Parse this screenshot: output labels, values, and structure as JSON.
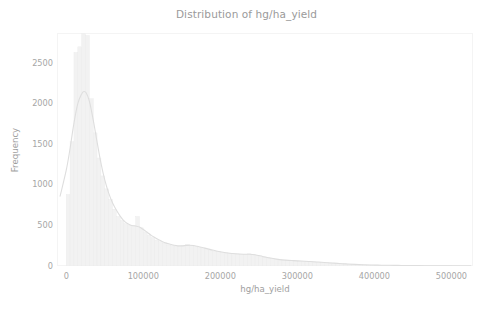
{
  "figure": {
    "width": 493,
    "height": 309,
    "background_color": "#ffffff"
  },
  "chart_data": {
    "type": "bar",
    "subtype": "histogram-with-kde",
    "title": "Distribution of hg/ha_yield",
    "xlabel": "hg/ha_yield",
    "ylabel": "Frequency",
    "xlim": [
      -12000,
      528000
    ],
    "ylim": [
      0,
      2870
    ],
    "grid": false,
    "legend": null,
    "xticks": [
      0,
      100000,
      200000,
      300000,
      400000,
      500000
    ],
    "xtick_labels": [
      "0",
      "100000",
      "200000",
      "300000",
      "400000",
      "500000"
    ],
    "yticks": [
      0,
      500,
      1000,
      1500,
      2000,
      2500
    ],
    "ytick_labels": [
      "0",
      "500",
      "1000",
      "1500",
      "2000",
      "2500"
    ],
    "bin_width": 5000,
    "bar_color": "#f2f2f2",
    "bar_edge_color": "#eaeaea",
    "kde_color": "#dedede",
    "axis_color": "#f2f2f2",
    "text_color": "#a3a3a3",
    "bins": [
      {
        "x": 2500,
        "value": 880
      },
      {
        "x": 7500,
        "value": 1530
      },
      {
        "x": 12500,
        "value": 2630
      },
      {
        "x": 17500,
        "value": 2700
      },
      {
        "x": 22500,
        "value": 2860
      },
      {
        "x": 27500,
        "value": 2840
      },
      {
        "x": 32500,
        "value": 2060
      },
      {
        "x": 37500,
        "value": 1640
      },
      {
        "x": 42500,
        "value": 1330
      },
      {
        "x": 47500,
        "value": 1110
      },
      {
        "x": 52500,
        "value": 950
      },
      {
        "x": 57500,
        "value": 820
      },
      {
        "x": 62500,
        "value": 700
      },
      {
        "x": 67500,
        "value": 610
      },
      {
        "x": 72500,
        "value": 560
      },
      {
        "x": 77500,
        "value": 520
      },
      {
        "x": 82500,
        "value": 500
      },
      {
        "x": 87500,
        "value": 500
      },
      {
        "x": 92500,
        "value": 610
      },
      {
        "x": 97500,
        "value": 470
      },
      {
        "x": 102500,
        "value": 420
      },
      {
        "x": 107500,
        "value": 380
      },
      {
        "x": 112500,
        "value": 350
      },
      {
        "x": 117500,
        "value": 320
      },
      {
        "x": 122500,
        "value": 300
      },
      {
        "x": 127500,
        "value": 280
      },
      {
        "x": 132500,
        "value": 260
      },
      {
        "x": 137500,
        "value": 250
      },
      {
        "x": 142500,
        "value": 245
      },
      {
        "x": 147500,
        "value": 240
      },
      {
        "x": 152500,
        "value": 250
      },
      {
        "x": 157500,
        "value": 265
      },
      {
        "x": 162500,
        "value": 255
      },
      {
        "x": 167500,
        "value": 240
      },
      {
        "x": 172500,
        "value": 225
      },
      {
        "x": 177500,
        "value": 215
      },
      {
        "x": 182500,
        "value": 205
      },
      {
        "x": 187500,
        "value": 195
      },
      {
        "x": 192500,
        "value": 185
      },
      {
        "x": 197500,
        "value": 175
      },
      {
        "x": 202500,
        "value": 168
      },
      {
        "x": 207500,
        "value": 160
      },
      {
        "x": 212500,
        "value": 155
      },
      {
        "x": 217500,
        "value": 150
      },
      {
        "x": 222500,
        "value": 148
      },
      {
        "x": 227500,
        "value": 145
      },
      {
        "x": 232500,
        "value": 143
      },
      {
        "x": 237500,
        "value": 150
      },
      {
        "x": 242500,
        "value": 142
      },
      {
        "x": 247500,
        "value": 130
      },
      {
        "x": 252500,
        "value": 120
      },
      {
        "x": 257500,
        "value": 110
      },
      {
        "x": 262500,
        "value": 100
      },
      {
        "x": 267500,
        "value": 92
      },
      {
        "x": 272500,
        "value": 85
      },
      {
        "x": 277500,
        "value": 78
      },
      {
        "x": 282500,
        "value": 72
      },
      {
        "x": 287500,
        "value": 68
      },
      {
        "x": 292500,
        "value": 65
      },
      {
        "x": 297500,
        "value": 62
      },
      {
        "x": 302500,
        "value": 60
      },
      {
        "x": 307500,
        "value": 58
      },
      {
        "x": 312500,
        "value": 55
      },
      {
        "x": 317500,
        "value": 52
      },
      {
        "x": 322500,
        "value": 50
      },
      {
        "x": 327500,
        "value": 47
      },
      {
        "x": 332500,
        "value": 44
      },
      {
        "x": 337500,
        "value": 40
      },
      {
        "x": 342500,
        "value": 37
      },
      {
        "x": 347500,
        "value": 34
      },
      {
        "x": 352500,
        "value": 31
      },
      {
        "x": 357500,
        "value": 28
      },
      {
        "x": 362500,
        "value": 25
      },
      {
        "x": 367500,
        "value": 22
      },
      {
        "x": 372500,
        "value": 20
      },
      {
        "x": 377500,
        "value": 18
      },
      {
        "x": 382500,
        "value": 16
      },
      {
        "x": 387500,
        "value": 14
      },
      {
        "x": 392500,
        "value": 13
      },
      {
        "x": 397500,
        "value": 12
      },
      {
        "x": 402500,
        "value": 11
      },
      {
        "x": 407500,
        "value": 10
      },
      {
        "x": 412500,
        "value": 9
      },
      {
        "x": 417500,
        "value": 8
      },
      {
        "x": 422500,
        "value": 8
      },
      {
        "x": 427500,
        "value": 7
      },
      {
        "x": 432500,
        "value": 6
      },
      {
        "x": 437500,
        "value": 6
      },
      {
        "x": 442500,
        "value": 5
      },
      {
        "x": 447500,
        "value": 5
      },
      {
        "x": 452500,
        "value": 4
      },
      {
        "x": 457500,
        "value": 4
      },
      {
        "x": 462500,
        "value": 3
      },
      {
        "x": 467500,
        "value": 3
      },
      {
        "x": 472500,
        "value": 3
      },
      {
        "x": 477500,
        "value": 2
      },
      {
        "x": 482500,
        "value": 2
      },
      {
        "x": 487500,
        "value": 2
      },
      {
        "x": 492500,
        "value": 2
      },
      {
        "x": 497500,
        "value": 2
      },
      {
        "x": 502500,
        "value": 1
      },
      {
        "x": 507500,
        "value": 1
      }
    ],
    "kde": [
      {
        "x": -8000,
        "y": 860
      },
      {
        "x": 0,
        "y": 1180
      },
      {
        "x": 5000,
        "y": 1450
      },
      {
        "x": 10000,
        "y": 1760
      },
      {
        "x": 15000,
        "y": 2000
      },
      {
        "x": 20000,
        "y": 2120
      },
      {
        "x": 23000,
        "y": 2150
      },
      {
        "x": 26000,
        "y": 2130
      },
      {
        "x": 30000,
        "y": 2030
      },
      {
        "x": 35000,
        "y": 1800
      },
      {
        "x": 40000,
        "y": 1530
      },
      {
        "x": 45000,
        "y": 1270
      },
      {
        "x": 50000,
        "y": 1060
      },
      {
        "x": 55000,
        "y": 900
      },
      {
        "x": 60000,
        "y": 780
      },
      {
        "x": 65000,
        "y": 690
      },
      {
        "x": 70000,
        "y": 615
      },
      {
        "x": 75000,
        "y": 555
      },
      {
        "x": 80000,
        "y": 520
      },
      {
        "x": 85000,
        "y": 500
      },
      {
        "x": 90000,
        "y": 492
      },
      {
        "x": 95000,
        "y": 480
      },
      {
        "x": 100000,
        "y": 450
      },
      {
        "x": 105000,
        "y": 415
      },
      {
        "x": 110000,
        "y": 380
      },
      {
        "x": 115000,
        "y": 350
      },
      {
        "x": 120000,
        "y": 322
      },
      {
        "x": 125000,
        "y": 300
      },
      {
        "x": 130000,
        "y": 282
      },
      {
        "x": 135000,
        "y": 268
      },
      {
        "x": 140000,
        "y": 255
      },
      {
        "x": 145000,
        "y": 248
      },
      {
        "x": 150000,
        "y": 248
      },
      {
        "x": 155000,
        "y": 252
      },
      {
        "x": 160000,
        "y": 256
      },
      {
        "x": 165000,
        "y": 252
      },
      {
        "x": 170000,
        "y": 243
      },
      {
        "x": 175000,
        "y": 232
      },
      {
        "x": 180000,
        "y": 220
      },
      {
        "x": 185000,
        "y": 208
      },
      {
        "x": 190000,
        "y": 196
      },
      {
        "x": 195000,
        "y": 185
      },
      {
        "x": 200000,
        "y": 175
      },
      {
        "x": 210000,
        "y": 160
      },
      {
        "x": 220000,
        "y": 150
      },
      {
        "x": 230000,
        "y": 145
      },
      {
        "x": 238000,
        "y": 145
      },
      {
        "x": 245000,
        "y": 138
      },
      {
        "x": 255000,
        "y": 118
      },
      {
        "x": 265000,
        "y": 98
      },
      {
        "x": 275000,
        "y": 82
      },
      {
        "x": 285000,
        "y": 72
      },
      {
        "x": 295000,
        "y": 66
      },
      {
        "x": 305000,
        "y": 61
      },
      {
        "x": 315000,
        "y": 56
      },
      {
        "x": 325000,
        "y": 50
      },
      {
        "x": 335000,
        "y": 44
      },
      {
        "x": 345000,
        "y": 37
      },
      {
        "x": 355000,
        "y": 30
      },
      {
        "x": 365000,
        "y": 25
      },
      {
        "x": 375000,
        "y": 20
      },
      {
        "x": 385000,
        "y": 16
      },
      {
        "x": 395000,
        "y": 13
      },
      {
        "x": 405000,
        "y": 11
      },
      {
        "x": 415000,
        "y": 9
      },
      {
        "x": 425000,
        "y": 8
      },
      {
        "x": 435000,
        "y": 7
      },
      {
        "x": 445000,
        "y": 6
      },
      {
        "x": 455000,
        "y": 5
      },
      {
        "x": 465000,
        "y": 4
      },
      {
        "x": 475000,
        "y": 4
      },
      {
        "x": 485000,
        "y": 3
      },
      {
        "x": 495000,
        "y": 3
      },
      {
        "x": 505000,
        "y": 2
      },
      {
        "x": 515000,
        "y": 2
      },
      {
        "x": 525000,
        "y": 2
      }
    ]
  }
}
